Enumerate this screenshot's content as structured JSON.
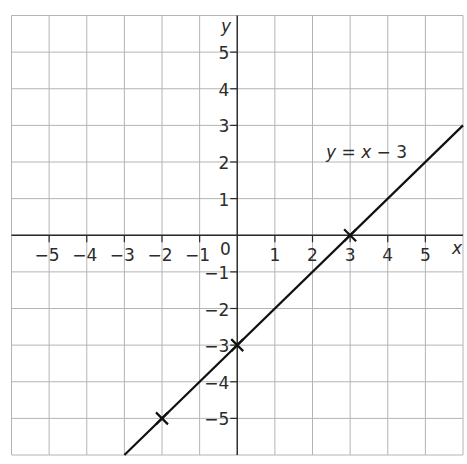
{
  "chart_data": {
    "type": "line",
    "title": "",
    "xlabel": "x",
    "ylabel": "y",
    "xlim": [
      -6,
      6
    ],
    "ylim": [
      -6,
      6
    ],
    "grid": true,
    "origin_label": "0",
    "x_ticks": [
      -5,
      -4,
      -3,
      -2,
      -1,
      1,
      2,
      3,
      4,
      5
    ],
    "x_tick_labels": [
      "−5",
      "−4",
      "−3",
      "−2",
      "−1",
      "1",
      "2",
      "3",
      "4",
      "5"
    ],
    "y_ticks": [
      5,
      4,
      3,
      2,
      1,
      -1,
      -2,
      -3,
      -4,
      -5
    ],
    "y_tick_labels": [
      "5",
      "4",
      "3",
      "2",
      "1",
      "−1",
      "−2",
      "−3",
      "−4",
      "−5"
    ],
    "series": [
      {
        "name": "y = x − 3",
        "equation": "y = x - 3",
        "x": [
          -3,
          6
        ],
        "y": [
          -6,
          3
        ],
        "color": "#111111"
      }
    ],
    "marked_points": [
      {
        "x": -2,
        "y": -5
      },
      {
        "x": 0,
        "y": -3
      },
      {
        "x": 3,
        "y": 0
      }
    ],
    "annotations": [
      {
        "text": "y = x − 3",
        "x": 1.6,
        "y": 2.1
      }
    ],
    "legend": "none"
  },
  "labels": {
    "x_axis": "x",
    "y_axis": "y",
    "origin": "0",
    "equation_y": "y",
    "equation_eq": " = ",
    "equation_x": "x",
    "equation_rest": " − 3"
  }
}
